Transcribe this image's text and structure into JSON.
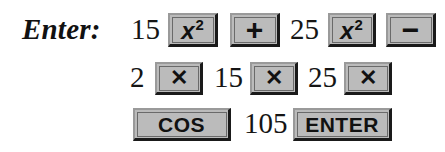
{
  "label": "Enter:",
  "rows": [
    {
      "items": [
        {
          "type": "number",
          "text": "15"
        },
        {
          "type": "key",
          "name": "x-squared",
          "text": "x",
          "sup": "2"
        },
        {
          "type": "key",
          "name": "plus",
          "text": "+"
        },
        {
          "type": "number",
          "text": "25"
        },
        {
          "type": "key",
          "name": "x-squared",
          "text": "x",
          "sup": "2"
        },
        {
          "type": "key",
          "name": "minus",
          "text": "−"
        }
      ]
    },
    {
      "items": [
        {
          "type": "number",
          "text": "2"
        },
        {
          "type": "key",
          "name": "multiply",
          "text": "✕"
        },
        {
          "type": "number",
          "text": "15"
        },
        {
          "type": "key",
          "name": "multiply",
          "text": "✕"
        },
        {
          "type": "number",
          "text": "25"
        },
        {
          "type": "key",
          "name": "multiply",
          "text": "✕"
        }
      ]
    },
    {
      "items": [
        {
          "type": "key",
          "name": "cos",
          "text": "COS"
        },
        {
          "type": "number",
          "text": "105"
        },
        {
          "type": "key",
          "name": "enter",
          "text": "ENTER"
        }
      ]
    }
  ],
  "colors": {
    "key_face": "#c4c4c4",
    "key_shadow": "#1a1a1a",
    "key_highlight": "#9a9a9a",
    "text": "#111111"
  }
}
